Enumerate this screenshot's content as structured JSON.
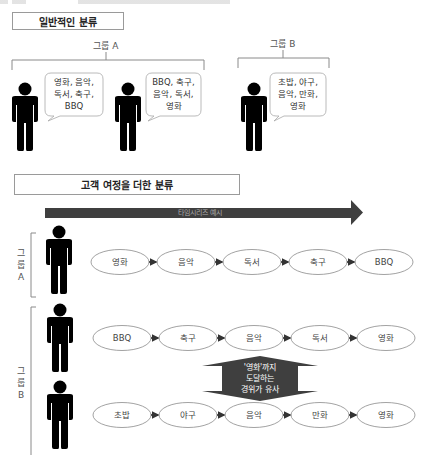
{
  "section1": {
    "title": "일반적인 분류",
    "group_a": {
      "label": "그룹 A",
      "bubbles": [
        {
          "lines": [
            "영화, 음악,",
            "독서, 축구,",
            "BBQ"
          ]
        },
        {
          "lines": [
            "BBQ, 축구,",
            "음악, 독서,",
            "영화"
          ]
        }
      ]
    },
    "group_b": {
      "label": "그룹 B",
      "bubbles": [
        {
          "lines": [
            "초밥, 야구,",
            "음악, 만화,",
            "영화"
          ]
        }
      ]
    }
  },
  "section2": {
    "title": "고객 여정을 더한 분류",
    "timeline_label": "타임시리즈 예시",
    "group_a": {
      "label_chars": [
        "그",
        "룹",
        "A"
      ],
      "rows": [
        {
          "steps": [
            "영화",
            "음악",
            "독서",
            "축구",
            "BBQ"
          ]
        }
      ]
    },
    "group_b": {
      "label_chars": [
        "그",
        "룹",
        "B"
      ],
      "rows": [
        {
          "steps": [
            "BBQ",
            "축구",
            "음악",
            "독서",
            "영화"
          ]
        },
        {
          "steps": [
            "초밥",
            "야구",
            "음악",
            "만화",
            "영화"
          ]
        }
      ]
    },
    "similarity_note": {
      "lines": [
        "'영화'까지",
        "도달하는",
        "경위가 유사"
      ]
    }
  },
  "colors": {
    "dark_arrow": "#3f3f3f",
    "person": "#000000",
    "outline": "#9a9a9a",
    "connector": "#333333"
  }
}
